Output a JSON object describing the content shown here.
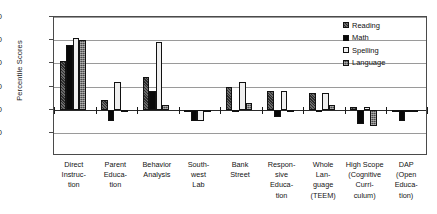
{
  "chart_data": {
    "type": "bar",
    "title": "",
    "xlabel": "",
    "ylabel": "Percentile Scores",
    "ylim": [
      0,
      60
    ],
    "yticks": [
      10,
      20,
      30,
      40,
      50,
      60
    ],
    "baseline": 20,
    "grid": true,
    "legend_position": "top-right",
    "categories": [
      "Direct Instruction",
      "Parent Education",
      "Behavior Analysis",
      "Southwest Lab",
      "Bank Street",
      "Responsive Education",
      "Whole Language (TEEM)",
      "High Scope (Cognitive Curriculum)",
      "DAP (Open Education)"
    ],
    "category_label_lines": [
      [
        "Direct",
        "Instruc-",
        "tion"
      ],
      [
        "Parent",
        "Educa-",
        "tion"
      ],
      [
        "Behavior",
        "Analysis"
      ],
      [
        "South-",
        "west",
        "Lab"
      ],
      [
        "Bank",
        "Street"
      ],
      [
        "Respon-",
        "sive",
        "Educa-",
        "tion"
      ],
      [
        "Whole",
        "Lan-",
        "guage",
        "(TEEM)"
      ],
      [
        "High Scope",
        "(Cognitive",
        "Curri-",
        "culum)"
      ],
      [
        "DAP",
        "(Open",
        "Educa-",
        "tion)"
      ]
    ],
    "series": [
      {
        "name": "Reading",
        "swatch": "sw-reading",
        "values": [
          41,
          24,
          34,
          20,
          30,
          28,
          27,
          21,
          19
        ]
      },
      {
        "name": "Math",
        "swatch": "sw-math",
        "values": [
          48,
          15,
          28,
          15,
          20,
          17,
          19,
          14,
          15
        ]
      },
      {
        "name": "Spelling",
        "swatch": "sw-spelling",
        "values": [
          51,
          32,
          49,
          15,
          32,
          28,
          27,
          21,
          20
        ]
      },
      {
        "name": "Language",
        "swatch": "sw-language",
        "values": [
          50,
          20,
          22,
          19,
          23,
          19,
          22,
          13,
          20
        ]
      }
    ]
  },
  "colors": {
    "reading": "#2b2b2b",
    "math": "#080808",
    "spelling": "#efefef",
    "language": "#4a4a4a",
    "axis": "#4a4a4a",
    "grid": "#9a9a9a"
  }
}
